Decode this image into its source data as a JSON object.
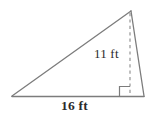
{
  "figure": {
    "name": "triangle-with-height",
    "shape": "triangle",
    "units": "ft",
    "background_color": "#ffffff",
    "stroke_color": "#7c7c7c",
    "text_color": "#2b2b2b",
    "labels": {
      "height": "11 ft",
      "base": "16 ft"
    },
    "measurements": {
      "base_value": 16,
      "height_value": 11,
      "unit_label": "ft"
    },
    "vertices": {
      "left": [
        12,
        96
      ],
      "apex": [
        131,
        11
      ],
      "right": [
        144,
        96
      ],
      "foot_of_height": [
        130,
        96
      ]
    },
    "elements": {
      "hypotenuse_name": "triangle-left-side",
      "right_side_name": "triangle-right-side",
      "base_name": "triangle-base",
      "height_name": "height-dashed-line",
      "right_angle_name": "right-angle-marker"
    }
  }
}
